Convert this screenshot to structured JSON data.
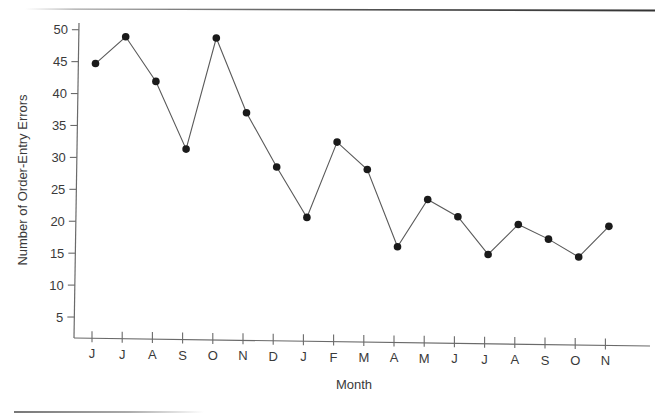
{
  "chart_data": {
    "type": "line",
    "title": "",
    "xlabel": "Month",
    "ylabel": "Number of Order-Entry Errors",
    "categories": [
      "J",
      "J",
      "A",
      "S",
      "O",
      "N",
      "D",
      "J",
      "F",
      "M",
      "A",
      "M",
      "J",
      "J",
      "A",
      "S",
      "O",
      "N"
    ],
    "series": [
      {
        "name": "Order-Entry Errors",
        "values": [
          44.7,
          48.9,
          41.9,
          31.3,
          48.7,
          37.0,
          28.5,
          20.6,
          32.4,
          28.1,
          16.0,
          23.4,
          20.7,
          14.8,
          19.5,
          17.2,
          14.4,
          19.2
        ],
        "color": "#1a1a1a",
        "marker": "circle"
      }
    ],
    "yticks": [
      5,
      10,
      15,
      20,
      25,
      30,
      35,
      40,
      45,
      50
    ],
    "ylim": [
      0,
      52
    ],
    "grid": false,
    "legend": "none"
  },
  "colors": {
    "line": "#5a5a5a",
    "marker": "#1a1a1a",
    "axis": "#6a6a6a",
    "text": "#3a3a3a"
  }
}
